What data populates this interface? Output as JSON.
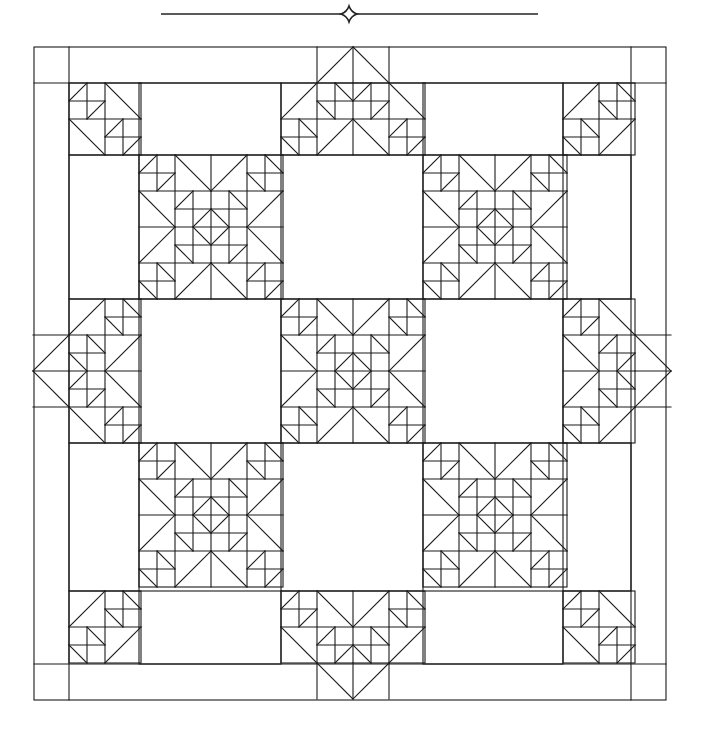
{
  "colors": {
    "line": "#1a1a1a",
    "background": "#ffffff"
  },
  "ornament": {
    "x1": 161,
    "x2": 538,
    "y": 14,
    "cx": 349,
    "size": 8,
    "icon": "four-point-star-icon"
  },
  "frame": {
    "outer": {
      "x": 34,
      "y": 47,
      "w": 632,
      "h": 653
    },
    "inner_v": [
      69,
      631
    ],
    "inner_h": [
      83,
      664
    ]
  },
  "cell": 18,
  "full_blocks": [
    {
      "name": "block-r1-c1",
      "x": 139,
      "y": 155
    },
    {
      "name": "block-r1-c3",
      "x": 423,
      "y": 155
    },
    {
      "name": "block-r2-c2",
      "x": 281,
      "y": 299
    },
    {
      "name": "block-r3-c1",
      "x": 139,
      "y": 443
    },
    {
      "name": "block-r3-c3",
      "x": 423,
      "y": 443
    }
  ],
  "corner_blocks": [
    {
      "name": "corner-top-left",
      "x": 69,
      "y": 83,
      "rot": 0
    },
    {
      "name": "corner-top-right",
      "x": 563,
      "y": 83,
      "rot": 90
    },
    {
      "name": "corner-bottom-right",
      "x": 563,
      "y": 591,
      "rot": 180
    },
    {
      "name": "corner-bottom-left",
      "x": 69,
      "y": 591,
      "rot": 270
    }
  ],
  "edge_blocks": [
    {
      "name": "edge-top",
      "x": 281,
      "y": 83,
      "rot": 0
    },
    {
      "name": "edge-right",
      "x": 563,
      "y": 299,
      "rot": 90
    },
    {
      "name": "edge-bottom",
      "x": 281,
      "y": 591,
      "rot": 180
    },
    {
      "name": "edge-left",
      "x": 69,
      "y": 299,
      "rot": 270
    }
  ],
  "setting_squares": [
    {
      "x": 139,
      "y": 83,
      "w": 142,
      "h": 72
    },
    {
      "x": 423,
      "y": 83,
      "w": 140,
      "h": 72
    },
    {
      "x": 69,
      "y": 155,
      "w": 70,
      "h": 144
    },
    {
      "x": 281,
      "y": 155,
      "w": 142,
      "h": 144
    },
    {
      "x": 563,
      "y": 155,
      "w": 68,
      "h": 144
    },
    {
      "x": 139,
      "y": 299,
      "w": 142,
      "h": 144
    },
    {
      "x": 423,
      "y": 299,
      "w": 140,
      "h": 144
    },
    {
      "x": 69,
      "y": 443,
      "w": 70,
      "h": 148
    },
    {
      "x": 281,
      "y": 443,
      "w": 142,
      "h": 148
    },
    {
      "x": 563,
      "y": 443,
      "w": 68,
      "h": 148
    },
    {
      "x": 139,
      "y": 591,
      "w": 142,
      "h": 73
    },
    {
      "x": 423,
      "y": 591,
      "w": 140,
      "h": 73
    }
  ]
}
